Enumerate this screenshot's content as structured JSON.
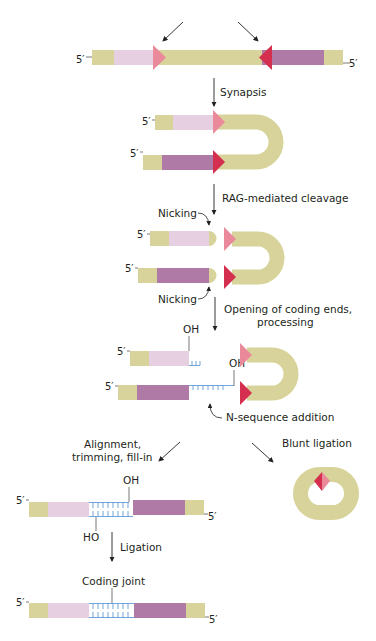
{
  "colors": {
    "flank": "#d7d39a",
    "light_coding": "#e6cfe0",
    "dark_coding": "#b07aa6",
    "rss_light": "#e9899a",
    "rss_dark": "#d42f4e",
    "n_sequence": "#4f8fd1",
    "arrow": "#231f20",
    "text": "#231f20"
  },
  "labels": {
    "five_prime": "5′",
    "synapsis": "Synapsis",
    "rag_cleavage": "RAG-mediated cleavage",
    "nicking_top": "Nicking",
    "nicking_bottom": "Nicking",
    "opening_line1": "Opening of coding ends,",
    "opening_line2": "processing",
    "oh_top": "OH",
    "oh_bottom": "OH",
    "n_sequence_addition": "N-sequence addition",
    "alignment_line1": "Alignment,",
    "alignment_line2": "trimming, fill-in",
    "blunt_ligation": "Blunt ligation",
    "oh_aligned": "OH",
    "ho_aligned": "HO",
    "ligation": "Ligation",
    "coding_joint": "Coding joint"
  }
}
